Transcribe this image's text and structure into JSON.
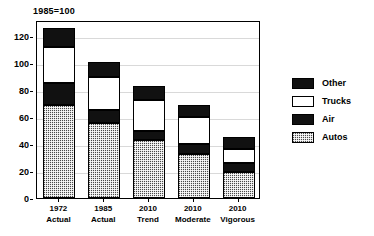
{
  "chart_data": {
    "type": "bar",
    "subtype": "stacked-bar",
    "title": "1985=100",
    "xlabel": "",
    "ylabel": "",
    "ylim": [
      0,
      126
    ],
    "yticks": [
      0,
      20,
      40,
      60,
      80,
      100,
      120
    ],
    "ytick_labels": [
      "0",
      "20",
      "40",
      "60",
      "80",
      "100",
      "120"
    ],
    "grid": true,
    "grid_axis": "y",
    "legend_position": "right",
    "categories": [
      "1972 Actual",
      "1985 Actual",
      "2010 Trend",
      "2010 Moderate",
      "2010 Vigorous"
    ],
    "category_lines": [
      {
        "line1": "1972",
        "line2": "Actual"
      },
      {
        "line1": "1985",
        "line2": "Actual"
      },
      {
        "line1": "2010",
        "line2": "Trend"
      },
      {
        "line1": "2010",
        "line2": "Moderate"
      },
      {
        "line1": "2010",
        "line2": "Vigorous"
      }
    ],
    "series": [
      {
        "name": "Autos",
        "values": [
          69,
          56,
          43,
          33,
          19
        ],
        "color": "#4a4a4a",
        "pattern": "dotted"
      },
      {
        "name": "Air",
        "values": [
          16,
          9,
          7,
          7,
          7
        ],
        "color": "#111111",
        "pattern": "solid"
      },
      {
        "name": "Trucks",
        "values": [
          27,
          25,
          23,
          20,
          10
        ],
        "color": "#ffffff",
        "pattern": "solid"
      },
      {
        "name": "Other",
        "values": [
          14,
          11,
          10,
          9,
          9
        ],
        "color": "#111111",
        "pattern": "solid"
      }
    ],
    "stack_order": [
      "Autos",
      "Air",
      "Trucks",
      "Other"
    ],
    "totals": [
      126,
      101,
      83,
      69,
      45
    ],
    "legend_entries": [
      {
        "label": "Other",
        "swatch": "black"
      },
      {
        "label": "Trucks",
        "swatch": "white"
      },
      {
        "label": "Air",
        "swatch": "black"
      },
      {
        "label": "Autos",
        "swatch": "dotted-gray"
      }
    ]
  },
  "axis": {
    "y_labels": [
      "120",
      "100",
      "80",
      "60",
      "40",
      "20",
      "0"
    ]
  },
  "legend": {
    "items": [
      {
        "label": "Other"
      },
      {
        "label": "Trucks"
      },
      {
        "label": "Air"
      },
      {
        "label": "Autos"
      }
    ]
  }
}
